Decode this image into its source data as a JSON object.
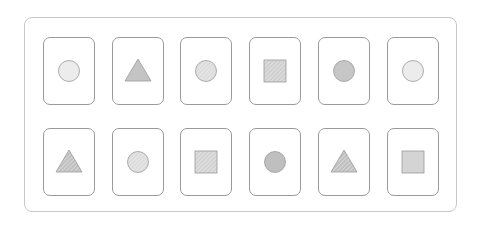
{
  "board": {
    "rows": 2,
    "columns": 6
  },
  "colors": {
    "card_border": "#9a9a9a",
    "board_border": "#c8c8c8",
    "shape_stroke": "#9a9a9a",
    "hatch_stroke": "#ffffff"
  },
  "cards": [
    {
      "row": 0,
      "col": 0,
      "shape": "circle",
      "fill": "#ececec",
      "pattern": "solid"
    },
    {
      "row": 0,
      "col": 1,
      "shape": "triangle",
      "fill": "#c4c4c4",
      "pattern": "solid"
    },
    {
      "row": 0,
      "col": 2,
      "shape": "circle",
      "fill": "#dcdcdc",
      "pattern": "hatched"
    },
    {
      "row": 0,
      "col": 3,
      "shape": "square",
      "fill": "#cfcfcf",
      "pattern": "hatched"
    },
    {
      "row": 0,
      "col": 4,
      "shape": "circle",
      "fill": "#c6c6c6",
      "pattern": "solid"
    },
    {
      "row": 0,
      "col": 5,
      "shape": "circle",
      "fill": "#ececec",
      "pattern": "solid"
    },
    {
      "row": 1,
      "col": 0,
      "shape": "triangle",
      "fill": "#c0c0c0",
      "pattern": "hatched"
    },
    {
      "row": 1,
      "col": 1,
      "shape": "circle",
      "fill": "#dcdcdc",
      "pattern": "hatched"
    },
    {
      "row": 1,
      "col": 2,
      "shape": "square",
      "fill": "#d2d2d2",
      "pattern": "hatched"
    },
    {
      "row": 1,
      "col": 3,
      "shape": "circle",
      "fill": "#bfbfbf",
      "pattern": "solid"
    },
    {
      "row": 1,
      "col": 4,
      "shape": "triangle",
      "fill": "#c0c0c0",
      "pattern": "hatched"
    },
    {
      "row": 1,
      "col": 5,
      "shape": "square",
      "fill": "#d4d4d4",
      "pattern": "solid"
    }
  ]
}
